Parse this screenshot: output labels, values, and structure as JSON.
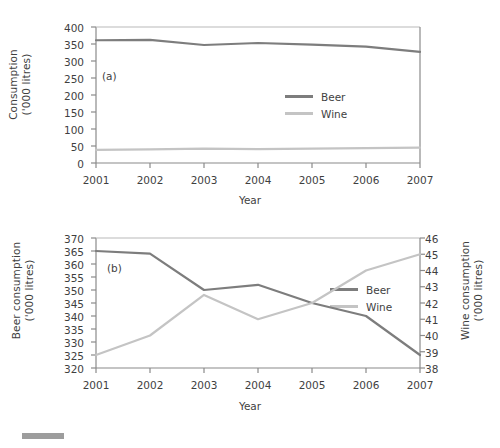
{
  "figure": {
    "panels": [
      "a",
      "b"
    ],
    "colors": {
      "beer": "#7d7d7d",
      "wine": "#c4c4c4",
      "axis": "#8a8a8a",
      "text": "#3f3f3f"
    },
    "footer_mark": ""
  },
  "panel_a": {
    "tag": "(a)",
    "ytitle_line1": "Consumption",
    "ytitle_line2": "('000 litres)",
    "xtitle": "Year",
    "legend": [
      {
        "label": "Beer",
        "color": "#7d7d7d"
      },
      {
        "label": "Wine",
        "color": "#c4c4c4"
      }
    ],
    "yticks": [
      "400",
      "350",
      "300",
      "250",
      "200",
      "150",
      "100",
      "50",
      "0"
    ],
    "xticks": [
      "2001",
      "2002",
      "2003",
      "2004",
      "2005",
      "2006",
      "2007"
    ]
  },
  "panel_b": {
    "tag": "(b)",
    "ytitle_line1": "Beer consumption",
    "ytitle_line2": "('000 litres)",
    "ytitle_right_line1": "Wine consumption",
    "ytitle_right_line2": "('000 litres)",
    "xtitle": "Year",
    "legend": [
      {
        "label": "Beer",
        "color": "#7d7d7d"
      },
      {
        "label": "Wine",
        "color": "#c4c4c4"
      }
    ],
    "yticks_left": [
      "370",
      "365",
      "360",
      "355",
      "350",
      "345",
      "340",
      "335",
      "330",
      "325",
      "320"
    ],
    "yticks_right": [
      "46",
      "45",
      "44",
      "43",
      "42",
      "41",
      "40",
      "39",
      "38"
    ],
    "xticks": [
      "2001",
      "2002",
      "2003",
      "2004",
      "2005",
      "2006",
      "2007"
    ]
  },
  "chart_data": [
    {
      "type": "line",
      "panel": "(a)",
      "title": "",
      "xlabel": "Year",
      "ylabel": "Consumption ('000 litres)",
      "x": [
        2001,
        2002,
        2003,
        2004,
        2005,
        2006,
        2007
      ],
      "xticklabels": [
        "2001",
        "2002",
        "2003",
        "2004",
        "2005",
        "2006",
        "2007"
      ],
      "ylim": [
        0,
        400
      ],
      "yticks": [
        0,
        50,
        100,
        150,
        200,
        250,
        300,
        350,
        400
      ],
      "grid": false,
      "legend": "inside-right",
      "series": [
        {
          "name": "Beer",
          "color": "#7d7d7d",
          "values": [
            361,
            362,
            347,
            353,
            348,
            342,
            327
          ]
        },
        {
          "name": "Wine",
          "color": "#c4c4c4",
          "values": [
            38.8,
            40,
            42.5,
            41,
            42,
            44,
            45
          ]
        }
      ]
    },
    {
      "type": "line",
      "panel": "(b)",
      "title": "",
      "xlabel": "Year",
      "ylabel": "Beer consumption ('000 litres)",
      "ylabel_right": "Wine consumption ('000 litres)",
      "x": [
        2001,
        2002,
        2003,
        2004,
        2005,
        2006,
        2007
      ],
      "xticklabels": [
        "2001",
        "2002",
        "2003",
        "2004",
        "2005",
        "2006",
        "2007"
      ],
      "ylim": [
        320,
        370
      ],
      "yticks": [
        320,
        325,
        330,
        335,
        340,
        345,
        350,
        355,
        360,
        365,
        370
      ],
      "ylim_right": [
        38,
        46
      ],
      "yticks_right": [
        38,
        39,
        40,
        41,
        42,
        43,
        44,
        45,
        46
      ],
      "grid": false,
      "legend": "inside-right",
      "series": [
        {
          "name": "Beer",
          "axis": "left",
          "color": "#7d7d7d",
          "values": [
            365,
            364,
            350,
            352,
            345,
            340,
            325
          ]
        },
        {
          "name": "Wine",
          "axis": "right",
          "color": "#c4c4c4",
          "values": [
            38.8,
            40,
            42.5,
            41,
            42,
            44,
            45
          ]
        }
      ]
    }
  ]
}
